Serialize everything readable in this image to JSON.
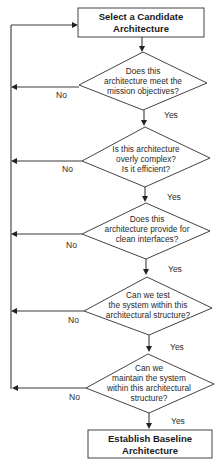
{
  "diagram": {
    "type": "flowchart",
    "start": {
      "lines": [
        "Select a Candidate",
        "Architecture"
      ]
    },
    "decisions": [
      {
        "lines": [
          "Does this",
          "architecture meet the",
          "mission objectives?"
        ],
        "yes": "Yes",
        "no": "No"
      },
      {
        "lines": [
          "Is this architecture",
          "overly complex?",
          "Is it efficient?"
        ],
        "yes": "Yes",
        "no": "No"
      },
      {
        "lines": [
          "Does this",
          "architecture provide for",
          "clean interfaces?"
        ],
        "yes": "Yes",
        "no": "No"
      },
      {
        "lines": [
          "Can we test",
          "the system within this",
          "architectural structure?"
        ],
        "yes": "Yes",
        "no": "No"
      },
      {
        "lines": [
          "Can we",
          "maintain the system",
          "within this architectural",
          "structure?"
        ],
        "yes": "Yes",
        "no": "No"
      }
    ],
    "end": {
      "lines": [
        "Establish Baseline",
        "Architecture"
      ]
    },
    "colors": {
      "stroke": "#444444",
      "text": "#1a1a1a",
      "background": "#ffffff"
    }
  }
}
